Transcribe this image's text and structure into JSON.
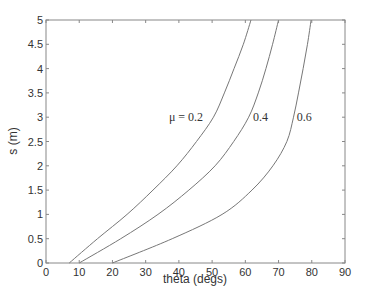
{
  "chart_data": {
    "type": "line",
    "title": "",
    "xlabel": "theta (degs)",
    "ylabel": "s (m)",
    "xlim": [
      0,
      90
    ],
    "ylim": [
      0,
      5
    ],
    "xticks": [
      0,
      10,
      20,
      30,
      40,
      50,
      60,
      70,
      80,
      90
    ],
    "yticks": [
      0,
      0.5,
      1,
      1.5,
      2,
      2.5,
      3,
      3.5,
      4,
      4.5,
      5
    ],
    "xtick_labels": [
      "0",
      "10",
      "20",
      "30",
      "40",
      "50",
      "60",
      "70",
      "80",
      "90"
    ],
    "ytick_labels": [
      "0",
      "0.5",
      "1",
      "1.5",
      "2",
      "2.5",
      "3",
      "3.5",
      "4",
      "4.5",
      "5"
    ],
    "grid": false,
    "legend": "inline labels",
    "series": [
      {
        "name": "μ = 0.2",
        "label": "μ = 0.2",
        "x": [
          7,
          15.5,
          24.4,
          32.2,
          39.4,
          45.3,
          50.4,
          53.7,
          56.6,
          59.4,
          61.7
        ],
        "y": [
          0,
          0.5,
          1,
          1.5,
          2,
          2.5,
          3,
          3.5,
          4,
          4.5,
          5
        ]
      },
      {
        "name": "μ = 0.4",
        "label": "0.4",
        "x": [
          10,
          22.5,
          33.7,
          43,
          50.9,
          56.5,
          61,
          63.9,
          66.2,
          68.2,
          70
        ],
        "y": [
          0,
          0.5,
          1,
          1.5,
          2,
          2.5,
          3,
          3.5,
          4,
          4.5,
          5
        ]
      },
      {
        "name": "μ = 0.6",
        "label": "0.6",
        "x": [
          20,
          38,
          53,
          62,
          68.3,
          72.5,
          74.5,
          76,
          77.4,
          78.7,
          79.8
        ],
        "y": [
          0,
          0.5,
          1,
          1.5,
          2,
          2.5,
          3,
          3.5,
          4,
          4.5,
          5
        ]
      }
    ],
    "annotations": [
      {
        "text": "μ = 0.2",
        "x": 37,
        "y": 3
      },
      {
        "text": "0.4",
        "x": 62.3,
        "y": 3
      },
      {
        "text": "0.6",
        "x": 75.5,
        "y": 3
      }
    ],
    "colors": {
      "axes": "#888888",
      "lines": "#777777",
      "text": "#333333"
    }
  }
}
